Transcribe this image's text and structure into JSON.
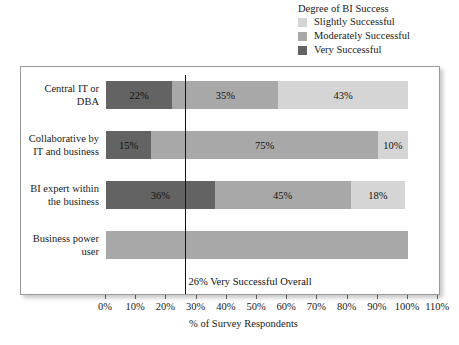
{
  "legend": {
    "title": "Degree of BI Success",
    "entries": [
      {
        "label": "Slightly Successful",
        "color": "#d5d5d5"
      },
      {
        "label": "Moderately Successful",
        "color": "#a8a8a8"
      },
      {
        "label": "Very Successful",
        "color": "#636363"
      }
    ]
  },
  "annotation": {
    "text": "26% Very Successful Overall",
    "value": 26
  },
  "axis": {
    "title": "% of Survey Respondents",
    "ticks": [
      "0%",
      "10%",
      "20%",
      "30%",
      "40%",
      "50%",
      "60%",
      "70%",
      "80%",
      "90%",
      "100%",
      "110%"
    ]
  },
  "chart_data": {
    "type": "bar",
    "orientation": "horizontal",
    "stacked": true,
    "title": "",
    "xlabel": "% of Survey Respondents",
    "ylabel": "",
    "xlim": [
      0,
      110
    ],
    "xticks": [
      0,
      10,
      20,
      30,
      40,
      50,
      60,
      70,
      80,
      90,
      100,
      110
    ],
    "grid": false,
    "legend_title": "Degree of BI Success",
    "legend_position": "top-right",
    "categories": [
      "Central IT or DBA",
      "Collaborative by IT and business",
      "BI expert within the business",
      "Business power user"
    ],
    "category_lines": [
      [
        "Central IT or",
        "DBA"
      ],
      [
        "Collaborative by",
        "IT and business"
      ],
      [
        "BI expert within",
        "the business"
      ],
      [
        "Business power",
        "user"
      ]
    ],
    "series": [
      {
        "name": "Very Successful",
        "color": "#636363",
        "values": [
          22,
          15,
          36,
          0
        ],
        "labels": [
          "22%",
          "15%",
          "36%",
          ""
        ]
      },
      {
        "name": "Moderately Successful",
        "color": "#a8a8a8",
        "values": [
          35,
          75,
          45,
          100
        ],
        "labels": [
          "35%",
          "75%",
          "45%",
          ""
        ]
      },
      {
        "name": "Slightly Successful",
        "color": "#d5d5d5",
        "values": [
          43,
          10,
          18,
          0
        ],
        "labels": [
          "43%",
          "10%",
          "18%",
          ""
        ]
      }
    ],
    "reference_line": {
      "value": 26,
      "label": "26% Very Successful Overall",
      "orientation": "vertical"
    }
  }
}
